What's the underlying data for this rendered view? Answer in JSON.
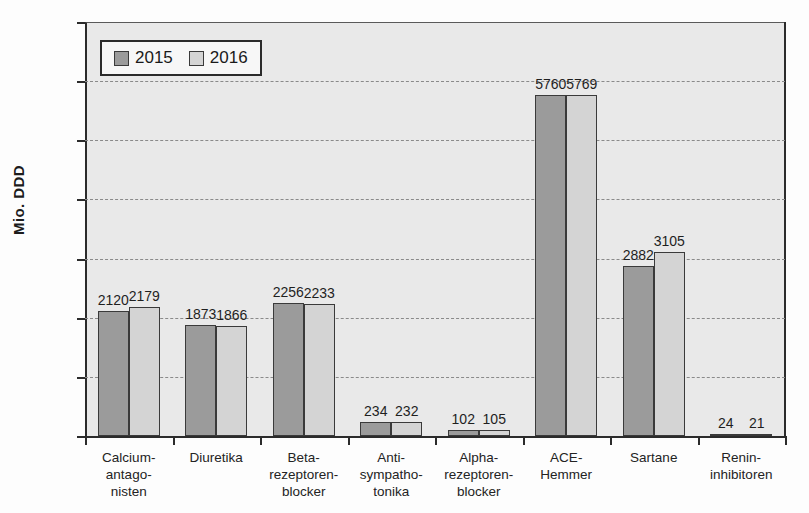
{
  "chart_data": {
    "type": "bar",
    "title": "",
    "subtitle": "",
    "xlabel": "",
    "ylabel": "Mio. DDD",
    "ylim": [
      0,
      7000
    ],
    "ytick_labels": [
      "7000",
      "6000",
      "5000",
      "4000",
      "3000",
      "2000",
      "1000",
      "0"
    ],
    "ytick_values": [
      7000,
      6000,
      5000,
      4000,
      3000,
      2000,
      1000,
      0
    ],
    "grid": true,
    "legend_position": "top-left",
    "categories": [
      "Calcium-\nantago-\nnisten",
      "Diuretika",
      "Beta-\nrezeptoren-\nblocker",
      "Anti-\nsympatho-\ntonika",
      "Alpha-\nrezeptoren-\nblocker",
      "ACE-\nHemmer",
      "Sartane",
      "Renin-\ninhibitoren"
    ],
    "category_lines": [
      [
        "Calcium-",
        "antago-",
        "nisten"
      ],
      [
        "Diuretika"
      ],
      [
        "Beta-",
        "rezeptoren-",
        "blocker"
      ],
      [
        "Anti-",
        "sympatho-",
        "tonika"
      ],
      [
        "Alpha-",
        "rezeptoren-",
        "blocker"
      ],
      [
        "ACE-",
        "Hemmer"
      ],
      [
        "Sartane"
      ],
      [
        "Renin-",
        "inhibitoren"
      ]
    ],
    "series": [
      {
        "name": "2015",
        "color": "#9b9b9b",
        "values": [
          2120,
          1873,
          2256,
          234,
          102,
          5760,
          2882,
          24
        ]
      },
      {
        "name": "2016",
        "color": "#d4d4d4",
        "values": [
          2179,
          1866,
          2233,
          232,
          105,
          5769,
          3105,
          21
        ]
      }
    ]
  },
  "legend": {
    "entries": [
      {
        "label": "2015",
        "color": "#9b9b9b"
      },
      {
        "label": "2016",
        "color": "#d4d4d4"
      }
    ]
  },
  "colors": {
    "series_2015": "#9b9b9b",
    "series_2016": "#d4d4d4",
    "plot_background": "#e9e9e9",
    "axis": "#2b2b2b",
    "gridline": "#8a8a8a"
  }
}
